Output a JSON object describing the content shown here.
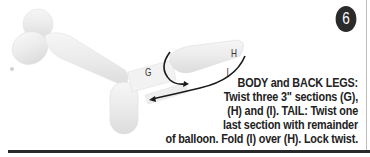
{
  "step": {
    "number": "6",
    "badge_color": "#2b2b2b"
  },
  "illustration": {
    "subject": "balloon-dog",
    "section_labels": {
      "g": "G",
      "h": "H",
      "i": "I"
    }
  },
  "caption": {
    "lines": [
      "BODY and BACK LEGS:",
      "Twist three 3\" sections (G),",
      "(H) and (I). TAIL: Twist one",
      "last section with remainder",
      "of balloon. Fold (I) over (H). Lock twist."
    ]
  },
  "colors": {
    "text": "#222222",
    "balloon": "#ececec",
    "rule": "#2a2a2a"
  }
}
